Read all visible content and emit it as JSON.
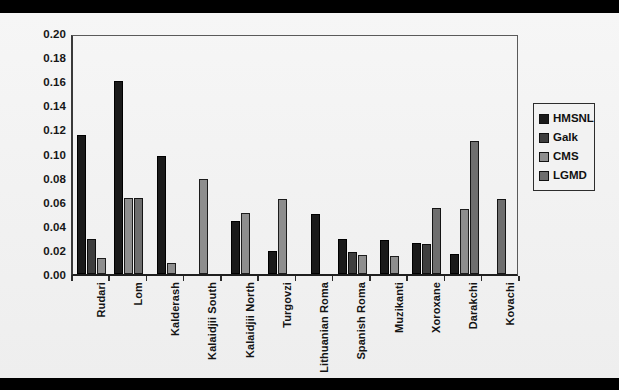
{
  "chart_data": {
    "type": "bar",
    "title": "",
    "xlabel": "",
    "ylabel": "",
    "ylim": [
      0,
      0.2
    ],
    "ytick_step": 0.02,
    "ytick_labels": [
      "0.20",
      "0.18",
      "0.16",
      "0.14",
      "0.12",
      "0.10",
      "0.08",
      "0.06",
      "0.04",
      "0.02",
      "0.00"
    ],
    "grid": false,
    "legend_position": "right",
    "categories": [
      "Rudari",
      "Lom",
      "Kalderash",
      "Kalaidjii South",
      "Kalaidjii North",
      "Turgovzi",
      "Lithuanian Roma",
      "Spanish Roma",
      "Muzikanti",
      "Xoroxane",
      "Darakchi",
      "Kovachi"
    ],
    "series": [
      {
        "name": "HMSNL",
        "color": "#1a1a1a",
        "values": [
          0.115,
          0.16,
          0.098,
          0,
          0.044,
          0.019,
          0.05,
          0.029,
          0.028,
          0.026,
          0.017,
          0
        ]
      },
      {
        "name": "Galk",
        "color": "#3e3e3e",
        "values": [
          0.029,
          0,
          0,
          0,
          0,
          0,
          0,
          0.018,
          0,
          0.025,
          0,
          0
        ]
      },
      {
        "name": "CMS",
        "color": "#8e8e8e",
        "values": [
          0.013,
          0.063,
          0.009,
          0.079,
          0.051,
          0.062,
          0,
          0.016,
          0.015,
          0,
          0.054,
          0
        ]
      },
      {
        "name": "LGMD",
        "color": "#6e6e6e",
        "values": [
          0,
          0.063,
          0,
          0,
          0,
          0,
          0,
          0,
          0,
          0.055,
          0.11,
          0.062
        ]
      }
    ]
  },
  "legend": {
    "items": [
      {
        "label": "HMSNL",
        "swatch": "legend-swatch-hmsnl"
      },
      {
        "label": "Galk",
        "swatch": "legend-swatch-galk"
      },
      {
        "label": "CMS",
        "swatch": "legend-swatch-cms"
      },
      {
        "label": "LGMD",
        "swatch": "legend-swatch-lgmd"
      }
    ]
  }
}
